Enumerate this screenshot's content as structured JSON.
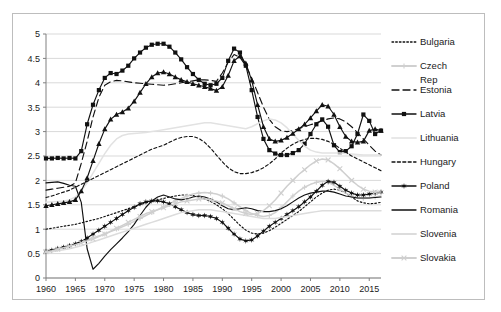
{
  "chart_data": {
    "type": "line",
    "title": "",
    "xlabel": "",
    "ylabel": "",
    "xlim": [
      1960,
      2017
    ],
    "ylim": [
      0,
      5
    ],
    "grid": true,
    "legend_position": "right",
    "x_ticks": [
      "1960",
      "1965",
      "1970",
      "1975",
      "1980",
      "1985",
      "1990",
      "1995",
      "2000",
      "2005",
      "2010",
      "2015"
    ],
    "y_ticks": [
      "0",
      "0.5",
      "1",
      "1.5",
      "2",
      "2.5",
      "3",
      "3.5",
      "4",
      "4.5",
      "5"
    ],
    "x": [
      1960,
      1961,
      1962,
      1963,
      1964,
      1965,
      1966,
      1967,
      1968,
      1969,
      1970,
      1971,
      1972,
      1973,
      1974,
      1975,
      1976,
      1977,
      1978,
      1979,
      1980,
      1981,
      1982,
      1983,
      1984,
      1985,
      1986,
      1987,
      1988,
      1989,
      1990,
      1991,
      1992,
      1993,
      1994,
      1995,
      1996,
      1997,
      1998,
      1999,
      2000,
      2001,
      2002,
      2003,
      2004,
      2005,
      2006,
      2007,
      2008,
      2009,
      2010,
      2011,
      2012,
      2013,
      2014,
      2015,
      2016,
      2017
    ],
    "series": [
      {
        "name": "Bulgaria",
        "style": "dotted",
        "color": "#111111",
        "marker": "none",
        "values": [
          1.0,
          1.02,
          1.04,
          1.06,
          1.08,
          1.1,
          1.13,
          1.16,
          1.19,
          1.22,
          1.26,
          1.3,
          1.34,
          1.38,
          1.42,
          1.46,
          1.5,
          1.54,
          1.57,
          1.6,
          1.63,
          1.66,
          1.68,
          1.7,
          1.7,
          1.69,
          1.66,
          1.62,
          1.57,
          1.5,
          1.42,
          1.32,
          1.2,
          1.08,
          0.98,
          0.92,
          0.9,
          0.92,
          0.97,
          1.04,
          1.12,
          1.2,
          1.28,
          1.36,
          1.46,
          1.56,
          1.66,
          1.74,
          1.8,
          1.82,
          1.8,
          1.74,
          1.66,
          1.58,
          1.54,
          1.52,
          1.53,
          1.55
        ]
      },
      {
        "name": "Czech Rep",
        "style": "solid",
        "color": "#d0d0d0",
        "marker": "cross",
        "values": [
          0.56,
          0.58,
          0.61,
          0.64,
          0.67,
          0.7,
          0.74,
          0.78,
          0.82,
          0.86,
          0.9,
          0.95,
          1.0,
          1.05,
          1.1,
          1.16,
          1.22,
          1.28,
          1.34,
          1.4,
          1.46,
          1.52,
          1.58,
          1.63,
          1.68,
          1.72,
          1.74,
          1.75,
          1.74,
          1.72,
          1.68,
          1.62,
          1.54,
          1.46,
          1.38,
          1.32,
          1.28,
          1.26,
          1.28,
          1.34,
          1.44,
          1.56,
          1.68,
          1.78,
          1.86,
          1.92,
          1.96,
          1.98,
          1.96,
          1.9,
          1.82,
          1.74,
          1.68,
          1.64,
          1.63,
          1.64,
          1.66,
          1.68
        ]
      },
      {
        "name": "Estonia",
        "style": "dashed",
        "color": "#111111",
        "marker": "none",
        "values": [
          1.8,
          1.82,
          1.84,
          1.86,
          1.88,
          1.95,
          2.35,
          2.8,
          3.3,
          3.7,
          3.95,
          4.02,
          4.05,
          4.04,
          4.02,
          4.0,
          3.99,
          3.98,
          3.97,
          3.96,
          3.95,
          3.96,
          3.98,
          4.0,
          4.02,
          4.04,
          4.06,
          4.06,
          4.05,
          4.03,
          4.2,
          4.42,
          4.58,
          4.52,
          4.35,
          4.1,
          3.8,
          3.5,
          3.25,
          3.1,
          3.02,
          3.0,
          3.02,
          3.06,
          3.1,
          3.14,
          3.18,
          3.22,
          3.26,
          3.28,
          3.26,
          3.2,
          3.1,
          2.98,
          2.85,
          2.72,
          2.6,
          2.52
        ]
      },
      {
        "name": "Latvia",
        "style": "solid",
        "color": "#111111",
        "marker": "square",
        "values": [
          2.45,
          2.45,
          2.46,
          2.45,
          2.46,
          2.45,
          2.6,
          3.15,
          3.55,
          3.85,
          4.1,
          4.2,
          4.18,
          4.25,
          4.35,
          4.5,
          4.62,
          4.72,
          4.78,
          4.8,
          4.8,
          4.74,
          4.62,
          4.48,
          4.32,
          4.18,
          4.06,
          3.98,
          3.95,
          3.98,
          4.1,
          4.45,
          4.7,
          4.62,
          4.35,
          3.85,
          3.3,
          2.85,
          2.62,
          2.55,
          2.52,
          2.52,
          2.56,
          2.62,
          2.75,
          2.95,
          3.15,
          3.25,
          3.1,
          2.72,
          2.58,
          2.6,
          2.7,
          2.95,
          3.35,
          3.22,
          2.95,
          3.02
        ]
      },
      {
        "name": "Lithuania",
        "style": "solid",
        "color": "#e2e2e2",
        "marker": "none",
        "values": [
          1.55,
          1.56,
          1.57,
          1.58,
          1.6,
          1.66,
          1.78,
          1.95,
          2.15,
          2.35,
          2.55,
          2.72,
          2.85,
          2.92,
          2.95,
          2.96,
          2.97,
          2.98,
          3.0,
          3.02,
          3.04,
          3.06,
          3.08,
          3.1,
          3.12,
          3.14,
          3.16,
          3.18,
          3.18,
          3.16,
          3.14,
          3.12,
          3.1,
          3.08,
          3.06,
          3.1,
          3.16,
          3.22,
          3.26,
          3.24,
          3.18,
          3.08,
          2.95,
          2.82,
          2.7,
          2.62,
          2.58,
          2.56,
          2.56,
          2.56,
          2.56,
          2.55,
          2.54,
          2.53,
          2.52,
          2.52,
          2.52,
          2.52
        ]
      },
      {
        "name": "Hungary",
        "style": "dashed-fine",
        "color": "#111111",
        "marker": "none",
        "values": [
          1.65,
          1.68,
          1.72,
          1.76,
          1.8,
          1.86,
          1.92,
          1.98,
          2.04,
          2.1,
          2.16,
          2.22,
          2.28,
          2.34,
          2.4,
          2.46,
          2.52,
          2.58,
          2.64,
          2.68,
          2.72,
          2.78,
          2.84,
          2.88,
          2.9,
          2.9,
          2.86,
          2.78,
          2.66,
          2.52,
          2.38,
          2.26,
          2.18,
          2.14,
          2.14,
          2.16,
          2.2,
          2.26,
          2.34,
          2.44,
          2.56,
          2.66,
          2.74,
          2.8,
          2.84,
          2.86,
          2.86,
          2.84,
          2.8,
          2.74,
          2.66,
          2.58,
          2.5,
          2.44,
          2.38,
          2.32,
          2.26,
          2.2
        ]
      },
      {
        "name": "Poland",
        "style": "solid",
        "color": "#111111",
        "marker": "star",
        "values": [
          0.55,
          0.57,
          0.6,
          0.63,
          0.66,
          0.7,
          0.75,
          0.82,
          0.9,
          0.98,
          1.06,
          1.14,
          1.22,
          1.3,
          1.38,
          1.45,
          1.52,
          1.56,
          1.58,
          1.58,
          1.56,
          1.52,
          1.46,
          1.4,
          1.34,
          1.3,
          1.28,
          1.28,
          1.26,
          1.22,
          1.14,
          1.02,
          0.9,
          0.8,
          0.76,
          0.78,
          0.86,
          0.96,
          1.06,
          1.14,
          1.22,
          1.3,
          1.38,
          1.46,
          1.56,
          1.66,
          1.78,
          1.9,
          1.98,
          1.96,
          1.88,
          1.8,
          1.74,
          1.7,
          1.7,
          1.72,
          1.74,
          1.76
        ]
      },
      {
        "name": "Romania",
        "style": "solid",
        "color": "#111111",
        "marker": "none",
        "values": [
          1.95,
          1.96,
          1.97,
          1.94,
          1.9,
          1.88,
          1.55,
          0.6,
          0.18,
          0.3,
          0.45,
          0.58,
          0.7,
          0.82,
          0.95,
          1.1,
          1.28,
          1.45,
          1.58,
          1.66,
          1.7,
          1.66,
          1.62,
          1.6,
          1.62,
          1.66,
          1.68,
          1.66,
          1.62,
          1.56,
          1.48,
          1.42,
          1.4,
          1.42,
          1.44,
          1.42,
          1.38,
          1.36,
          1.36,
          1.38,
          1.42,
          1.48,
          1.56,
          1.64,
          1.7,
          1.74,
          1.76,
          1.78,
          1.78,
          1.76,
          1.72,
          1.68,
          1.66,
          1.64,
          1.64,
          1.64,
          1.65,
          1.66
        ]
      },
      {
        "name": "Slovenia",
        "style": "solid",
        "color": "#dcdcdc",
        "marker": "none",
        "values": [
          0.52,
          0.54,
          0.56,
          0.58,
          0.6,
          0.63,
          0.66,
          0.7,
          0.74,
          0.78,
          0.82,
          0.86,
          0.9,
          0.94,
          0.98,
          1.02,
          1.06,
          1.1,
          1.14,
          1.18,
          1.22,
          1.26,
          1.3,
          1.34,
          1.36,
          1.38,
          1.4,
          1.4,
          1.4,
          1.38,
          1.36,
          1.34,
          1.32,
          1.3,
          1.28,
          1.26,
          1.24,
          1.22,
          1.22,
          1.22,
          1.24,
          1.26,
          1.28,
          1.3,
          1.32,
          1.34,
          1.36,
          1.38,
          1.38,
          1.38,
          1.38,
          1.38,
          1.38,
          1.38,
          1.38,
          1.38,
          1.38,
          1.38
        ]
      },
      {
        "name": "Slovakia",
        "style": "solid",
        "color": "#cfcfcf",
        "marker": "x",
        "values": [
          0.54,
          0.56,
          0.59,
          0.62,
          0.65,
          0.68,
          0.72,
          0.76,
          0.8,
          0.85,
          0.9,
          0.96,
          1.02,
          1.08,
          1.14,
          1.2,
          1.26,
          1.32,
          1.36,
          1.4,
          1.44,
          1.48,
          1.52,
          1.56,
          1.58,
          1.6,
          1.62,
          1.62,
          1.6,
          1.58,
          1.54,
          1.48,
          1.42,
          1.36,
          1.32,
          1.3,
          1.32,
          1.38,
          1.48,
          1.6,
          1.74,
          1.88,
          2.0,
          2.12,
          2.22,
          2.32,
          2.4,
          2.44,
          2.42,
          2.34,
          2.24,
          2.12,
          2.0,
          1.9,
          1.82,
          1.78,
          1.76,
          1.76
        ]
      },
      {
        "name": "Estonia-markers",
        "style": "solid",
        "color": "#111111",
        "marker": "triangle",
        "values": [
          1.48,
          1.5,
          1.52,
          1.54,
          1.56,
          1.6,
          1.78,
          2.05,
          2.4,
          2.75,
          3.05,
          3.25,
          3.35,
          3.4,
          3.48,
          3.62,
          3.8,
          3.98,
          4.12,
          4.2,
          4.22,
          4.18,
          4.12,
          4.06,
          4.02,
          3.98,
          3.95,
          3.92,
          3.88,
          3.84,
          3.92,
          4.15,
          4.45,
          4.55,
          4.4,
          4.05,
          3.55,
          3.1,
          2.85,
          2.8,
          2.82,
          2.88,
          2.96,
          3.05,
          3.15,
          3.28,
          3.42,
          3.55,
          3.52,
          3.35,
          3.1,
          2.9,
          2.8,
          2.78,
          2.8,
          3.02,
          3.05,
          3.02
        ]
      }
    ]
  },
  "legend": {
    "items": [
      {
        "label": "Bulgaria"
      },
      {
        "label": "Czech"
      },
      {
        "label": "Rep"
      },
      {
        "label": "Estonia"
      },
      {
        "label": "Latvia"
      },
      {
        "label": "Lithuania"
      },
      {
        "label": "Hungary"
      },
      {
        "label": "Poland"
      },
      {
        "label": "Romania"
      },
      {
        "label": "Slovenia"
      },
      {
        "label": "Slovakia"
      }
    ]
  },
  "colors": {
    "axis": "#808080",
    "grid": "#d9d9d9",
    "dark": "#111111",
    "frame": "#bdbdbd"
  }
}
